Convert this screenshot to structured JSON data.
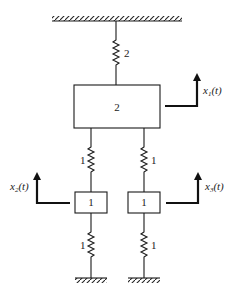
{
  "diagram": {
    "type": "mass-spring system",
    "top_spring": {
      "stiffness": "2"
    },
    "main_mass": {
      "value": "2",
      "displacement": "x",
      "displacement_sub": "1",
      "displacement_arg": "(t)"
    },
    "left_upper_spring": {
      "stiffness": "1"
    },
    "right_upper_spring": {
      "stiffness": "1"
    },
    "left_mass": {
      "value": "1",
      "displacement": "x",
      "displacement_sub": "2",
      "displacement_arg": "(t)"
    },
    "right_mass": {
      "value": "1",
      "displacement": "x",
      "displacement_sub": "3",
      "displacement_arg": "(t)"
    },
    "left_lower_spring": {
      "stiffness": "1"
    },
    "right_lower_spring": {
      "stiffness": "1"
    }
  }
}
